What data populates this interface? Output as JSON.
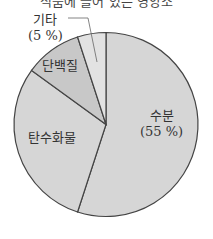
{
  "chart_data": {
    "type": "pie",
    "title": "식품에 들어 있는 영양소",
    "slices": [
      {
        "label": "수분",
        "value": 55,
        "value_label": "(55 %)",
        "color": "#d6d6d6"
      },
      {
        "label": "탄수화물",
        "value": 30,
        "value_label": "",
        "color": "#d6d6d6"
      },
      {
        "label": "단백질",
        "value": 10,
        "value_label": "",
        "color": "#c8c8c8"
      },
      {
        "label": "기타",
        "value": 5,
        "value_label": "(5 %)",
        "color": "#e2e2e2"
      }
    ],
    "start_angle": "12 o'clock",
    "direction": "clockwise",
    "legend": "none (labels on slices)"
  },
  "labels": {
    "title": "식품에 들어 있는 영양소",
    "water": "수분",
    "water_pct": "(55 %)",
    "carbs": "탄수화물",
    "protein": "단백질",
    "etc": "기타",
    "etc_pct": "(5 %)"
  }
}
